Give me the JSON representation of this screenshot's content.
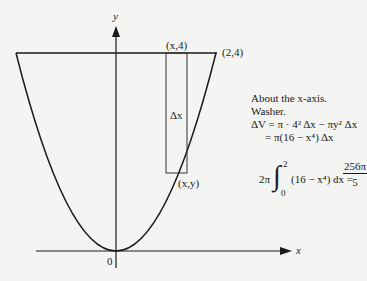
{
  "diagram": {
    "type": "solid-of-revolution washer method",
    "axes": {
      "x_label": "x",
      "y_label": "y",
      "origin_label": "0"
    },
    "curve": "y = x^2",
    "points": {
      "top_right": "(2,4)",
      "strip_top": "(x,4)",
      "strip_bottom": "(x,y)"
    },
    "strip_label": "Δx"
  },
  "notes": {
    "line1": "About the x-axis.",
    "line2": "Washer.",
    "line3": "ΔV = π · 4² Δx − πy² Δx",
    "line4": "= π(16 − x⁴) Δx"
  },
  "integral": {
    "coef": "2π",
    "lower": "0",
    "upper": "2",
    "integrand": "(16 − x⁴) dx =",
    "result_num": "256π",
    "result_den": "5"
  }
}
